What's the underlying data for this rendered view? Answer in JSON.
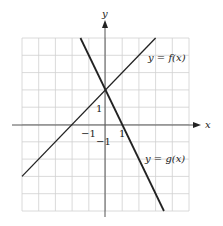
{
  "chart_data": {
    "type": "line",
    "title": "",
    "xlabel": "x",
    "ylabel": "y",
    "xlim": [
      -5,
      5
    ],
    "ylim": [
      -5,
      5
    ],
    "grid": true,
    "tick_labels": {
      "x": [
        "-1",
        "1"
      ],
      "y": [
        "-1",
        "1"
      ]
    },
    "series": [
      {
        "name": "y = f(x)",
        "label_parts": {
          "pre": "y = ",
          "fn": "f",
          "arg": "(x)"
        },
        "slope": 1,
        "intercept": 2,
        "x": [
          -5,
          3
        ],
        "y": [
          -3,
          5
        ]
      },
      {
        "name": "y = g(x)",
        "label_parts": {
          "pre": "y = ",
          "fn": "g",
          "arg": "(x)"
        },
        "slope": -2,
        "intercept": 2,
        "x": [
          -1.5,
          3.5
        ],
        "y": [
          5,
          -5
        ]
      }
    ]
  },
  "axes": {
    "x_label": "x",
    "y_label": "y",
    "x_tick_neg": "−1",
    "x_tick_pos": "1",
    "y_tick_pos": "1",
    "y_tick_neg": "−1"
  },
  "labels": {
    "f": "y = f(x)",
    "g": "y = g(x)"
  },
  "colors": {
    "grid": "#d0d0d0",
    "axis": "#555555",
    "line": "#222222"
  }
}
